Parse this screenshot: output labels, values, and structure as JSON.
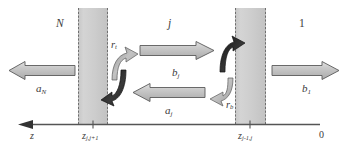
{
  "figure": {
    "kind": "physics-schematic",
    "colors": {
      "background": "#ffffff",
      "slab_fill": "#cfcfcf",
      "slab_edge": "#6e6e6e",
      "arrow_fill_light": "#c9c9c9",
      "arrow_fill_mid": "#b5b5b5",
      "arrow_fill_dark": "#2a2a2a",
      "arrow_edge": "#5a5a5a",
      "axis": "#555555",
      "text": "#3b3b3b"
    }
  },
  "regions": [
    {
      "name": "region-left",
      "label": "N",
      "italic": true
    },
    {
      "name": "region-middle",
      "label": "j",
      "italic": true
    },
    {
      "name": "region-right",
      "label": "1",
      "italic": false
    }
  ],
  "slabs": [
    {
      "name": "slab-left",
      "x": 78,
      "width": 30
    },
    {
      "name": "slab-right",
      "x": 235,
      "width": 31
    }
  ],
  "flux_arrows": [
    {
      "name": "amplitude-a-N",
      "base": "a",
      "sub": "N",
      "direction": "left",
      "label_x": 36,
      "label_y": 83
    },
    {
      "name": "amplitude-b-j",
      "base": "b",
      "sub": "j",
      "direction": "right",
      "label_x": 172,
      "label_y": 67
    },
    {
      "name": "amplitude-a-j",
      "base": "a",
      "sub": "j",
      "direction": "left",
      "label_x": 165,
      "label_y": 108
    },
    {
      "name": "amplitude-b-1",
      "base": "b",
      "sub": "1",
      "direction": "right",
      "label_x": 302,
      "label_y": 83
    }
  ],
  "reflection_labels": [
    {
      "name": "reflection-top",
      "base": "r",
      "sub": "t",
      "label_x": 112,
      "label_y": 46
    },
    {
      "name": "reflection-bottom",
      "base": "r",
      "sub": "b",
      "label_x": 226,
      "label_y": 104
    }
  ],
  "axis": {
    "name": "z-axis",
    "label": "z",
    "direction": "left",
    "ticks": [
      {
        "name": "tick-z-j-jplus1",
        "base": "z",
        "sub": "j,j+1",
        "x": 93,
        "label_x": 82,
        "label_y": 133
      },
      {
        "name": "tick-z-jminus1-j",
        "base": "z",
        "sub": "j-1,j",
        "x": 250,
        "label_x": 238,
        "label_y": 133
      },
      {
        "name": "tick-origin",
        "base": "0",
        "sub": "",
        "x": 320,
        "label_x": 319,
        "label_y": 132
      }
    ]
  }
}
